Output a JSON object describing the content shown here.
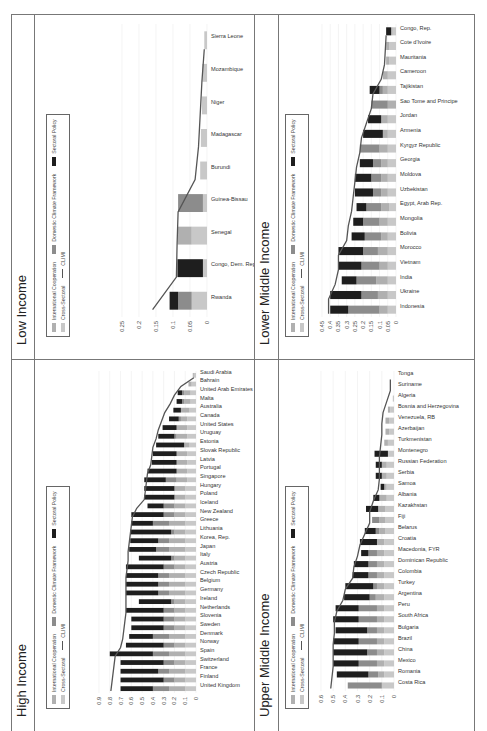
{
  "legend": {
    "items": [
      {
        "label": "International Cooperation",
        "key": "intl"
      },
      {
        "label": "Domestic Climate Framework",
        "key": "dom"
      },
      {
        "label": "Sectoral Policy",
        "key": "sect"
      },
      {
        "label": "Cross-Sectoral",
        "key": "cross"
      },
      {
        "label": "CLIMI",
        "key": "climi"
      }
    ],
    "colors": {
      "cross": "#c8c8c8",
      "intl": "#b0b0b0",
      "dom": "#8c8c8c",
      "sect": "#1e1e1e",
      "climi": "#555555"
    }
  },
  "chart_data": [
    {
      "type": "bar",
      "stacked": true,
      "title": "Low Income",
      "xlabel": "",
      "ylabel": "",
      "ylim": [
        0,
        0.25
      ],
      "yticks": [
        "0",
        "0.05",
        "0.1",
        "0.15",
        "0.2",
        "0.25"
      ],
      "categories": [
        "Rwanda",
        "Congo, Dem. Rep.",
        "Senegal",
        "Guinea-Bissau",
        "Burundi",
        "Madagascar",
        "Niger",
        "Mozambique",
        "Sierra Leone"
      ],
      "series": [
        {
          "name": "Cross-Sectoral",
          "values": [
            0.045,
            0.012,
            0.045,
            0.012,
            0.02,
            0.018,
            0.015,
            0.014,
            0.008
          ]
        },
        {
          "name": "International Cooperation",
          "values": [
            0,
            0,
            0.042,
            0,
            0,
            0,
            0,
            0,
            0
          ]
        },
        {
          "name": "Domestic Climate Framework",
          "values": [
            0.04,
            0,
            0,
            0.073,
            0,
            0,
            0,
            0,
            0
          ]
        },
        {
          "name": "Sectoral Policy",
          "values": [
            0.025,
            0.075,
            0,
            0,
            0,
            0,
            0,
            0,
            0
          ]
        },
        {
          "name": "CLIMI",
          "type": "line",
          "values": [
            0.16,
            0.09,
            0.088,
            0.085,
            0.035,
            0.025,
            0.02,
            0.015,
            0.008
          ]
        }
      ],
      "grid": true,
      "legend": "top-right"
    },
    {
      "type": "bar",
      "stacked": true,
      "title": "Lower Middle Income",
      "xlabel": "",
      "ylabel": "",
      "ylim": [
        0,
        0.45
      ],
      "yticks": [
        "0",
        "0.05",
        "0.1",
        "0.15",
        "0.2",
        "0.25",
        "0.3",
        "0.35",
        "0.4",
        "0.45"
      ],
      "categories": [
        "Indonesia",
        "Ukraine",
        "India",
        "Vietnam",
        "Morocco",
        "Bolivia",
        "Mongolia",
        "Egypt, Arab Rep.",
        "Uzbekistan",
        "Moldova",
        "Georgia",
        "Kyrgyz Republic",
        "Armenia",
        "Jordan",
        "Sao Tome and Principe",
        "Tajikistan",
        "Cameroon",
        "Mauritania",
        "Cote d'Ivoire",
        "Congo, Rep."
      ],
      "series": [
        {
          "name": "Cross-Sectoral",
          "values": [
            0.05,
            0.05,
            0.05,
            0.05,
            0.05,
            0.05,
            0.05,
            0.04,
            0.05,
            0.05,
            0.05,
            0.05,
            0.05,
            0.05,
            0.0,
            0.05,
            0.05,
            0.04,
            0.04,
            0.02
          ]
        },
        {
          "name": "International Cooperation",
          "values": [
            0.05,
            0.06,
            0.07,
            0.05,
            0.06,
            0.04,
            0.05,
            0.05,
            0.04,
            0.04,
            0.04,
            0.05,
            0.03,
            0.04,
            0.05,
            0.03,
            0.03,
            0.02,
            0.02,
            0.01
          ]
        },
        {
          "name": "Domestic Climate Framework",
          "values": [
            0.19,
            0.1,
            0.12,
            0.11,
            0.09,
            0.1,
            0.1,
            0.09,
            0.05,
            0.06,
            0.05,
            0.12,
            0,
            0,
            0.1,
            0.02,
            0.0,
            0.0,
            0,
            0
          ]
        },
        {
          "name": "Sectoral Policy",
          "values": [
            0.11,
            0.19,
            0.09,
            0.14,
            0.15,
            0.08,
            0.06,
            0.06,
            0.11,
            0.1,
            0.08,
            0,
            0.12,
            0.08,
            0,
            0.06,
            0,
            0,
            0,
            0.03
          ]
        },
        {
          "name": "CLIMI",
          "type": "line",
          "values": [
            0.41,
            0.41,
            0.37,
            0.35,
            0.35,
            0.3,
            0.29,
            0.27,
            0.26,
            0.25,
            0.24,
            0.22,
            0.21,
            0.18,
            0.15,
            0.14,
            0.09,
            0.07,
            0.065,
            0.06
          ]
        }
      ],
      "grid": true,
      "legend": "top-right"
    },
    {
      "type": "bar",
      "stacked": true,
      "title": "High Income",
      "xlabel": "",
      "ylabel": "",
      "ylim": [
        0,
        0.9
      ],
      "yticks": [
        "0",
        "0.1",
        "0.2",
        "0.3",
        "0.4",
        "0.5",
        "0.6",
        "0.7",
        "0.8",
        "0.9"
      ],
      "categories": [
        "United Kingdom",
        "Finland",
        "France",
        "Switzerland",
        "Spain",
        "Norway",
        "Denmark",
        "Sweden",
        "Slovenia",
        "Netherlands",
        "Ireland",
        "Germany",
        "Belgium",
        "Czech Republic",
        "Austria",
        "Italy",
        "Japan",
        "Korea, Rep.",
        "Lithuania",
        "Greece",
        "New Zealand",
        "Iceland",
        "Poland",
        "Hungary",
        "Singapore",
        "Portugal",
        "Latvia",
        "Slovak Republic",
        "Estonia",
        "Uruguay",
        "United States",
        "Canada",
        "Australia",
        "Malta",
        "United Arab Emirates",
        "Bahrain",
        "Saudi Arabia"
      ],
      "series": [
        {
          "name": "Cross-Sectoral",
          "values": [
            0.1,
            0.1,
            0.1,
            0.1,
            0.1,
            0.1,
            0.1,
            0.1,
            0.1,
            0.1,
            0.1,
            0.1,
            0.1,
            0.1,
            0.1,
            0.1,
            0.1,
            0.1,
            0.1,
            0.1,
            0.1,
            0.1,
            0.1,
            0.1,
            0.08,
            0.08,
            0.08,
            0.08,
            0.06,
            0.08,
            0.08,
            0.08,
            0.06,
            0.05,
            0.05,
            0.04,
            0.02
          ]
        },
        {
          "name": "International Cooperation",
          "values": [
            0.15,
            0.1,
            0.15,
            0.1,
            0.15,
            0.1,
            0.15,
            0.1,
            0.1,
            0.1,
            0.1,
            0.15,
            0.15,
            0.15,
            0.1,
            0.1,
            0.15,
            0.15,
            0.1,
            0.15,
            0.1,
            0.1,
            0.1,
            0.1,
            0.1,
            0.1,
            0.1,
            0.1,
            0.05,
            0.1,
            0.1,
            0.06,
            0.08,
            0.06,
            0.06,
            0.03,
            0.01
          ]
        },
        {
          "name": "Domestic Climate Framework",
          "values": [
            0.15,
            0.1,
            0.1,
            0.1,
            0.15,
            0.1,
            0.15,
            0.1,
            0.1,
            0.1,
            0.03,
            0.1,
            0.1,
            0.1,
            0.1,
            0.03,
            0.12,
            0.1,
            0.03,
            0.15,
            0.1,
            0.1,
            0.0,
            0.0,
            0.1,
            0.0,
            0.0,
            0.0,
            0.0,
            0.02,
            0.0,
            0.02,
            0.0,
            0.02,
            0.02,
            0.0,
            0.0
          ]
        },
        {
          "name": "Sectoral Policy",
          "values": [
            0.3,
            0.4,
            0.35,
            0.4,
            0.4,
            0.35,
            0.22,
            0.3,
            0.3,
            0.35,
            0.3,
            0.3,
            0.3,
            0.3,
            0.35,
            0.3,
            0.25,
            0.26,
            0.38,
            0.2,
            0.3,
            0.15,
            0.28,
            0.28,
            0.2,
            0.27,
            0.23,
            0.22,
            0.26,
            0.15,
            0.13,
            0.09,
            0.07,
            0.05,
            0.04,
            0.0,
            0.0
          ]
        },
        {
          "name": "CLIMI",
          "type": "line",
          "values": [
            0.79,
            0.78,
            0.77,
            0.76,
            0.75,
            0.7,
            0.68,
            0.67,
            0.66,
            0.65,
            0.65,
            0.65,
            0.65,
            0.65,
            0.64,
            0.63,
            0.63,
            0.62,
            0.61,
            0.6,
            0.59,
            0.55,
            0.48,
            0.47,
            0.46,
            0.45,
            0.42,
            0.41,
            0.4,
            0.37,
            0.35,
            0.32,
            0.29,
            0.24,
            0.2,
            0.14,
            0.02
          ]
        }
      ],
      "grid": true,
      "legend": "top-right"
    },
    {
      "type": "bar",
      "stacked": true,
      "title": "Upper Middle Income",
      "xlabel": "",
      "ylabel": "",
      "ylim": [
        0,
        0.6
      ],
      "yticks": [
        "0",
        "0.1",
        "0.2",
        "0.3",
        "0.4",
        "0.5",
        "0.6"
      ],
      "categories": [
        "Costa Rica",
        "Romania",
        "Mexico",
        "China",
        "Brazil",
        "Bulgaria",
        "South Africa",
        "Peru",
        "Argentina",
        "Turkey",
        "Colombia",
        "Dominican Republic",
        "Macedonia, FYR",
        "Croatia",
        "Belarus",
        "Fiji",
        "Kazakhstan",
        "Albania",
        "Samoa",
        "Serbia",
        "Russian Federation",
        "Montenegro",
        "Turkmenistan",
        "Azerbaijan",
        "Venezuela, RB",
        "Bosnia and Herzegovina",
        "Algeria",
        "Suriname",
        "Tonga"
      ],
      "series": [
        {
          "name": "Cross-Sectoral",
          "values": [
            0.1,
            0.08,
            0.08,
            0.08,
            0.08,
            0.08,
            0.08,
            0.08,
            0.08,
            0.08,
            0.08,
            0.08,
            0.08,
            0.08,
            0.07,
            0.07,
            0.07,
            0.06,
            0.06,
            0.06,
            0.06,
            0.05,
            0.05,
            0.04,
            0.04,
            0.03,
            0.01,
            0.0,
            0.0
          ]
        },
        {
          "name": "International Cooperation",
          "values": [
            0.0,
            0.05,
            0.06,
            0.06,
            0.06,
            0.06,
            0.06,
            0.06,
            0.07,
            0.06,
            0.06,
            0.06,
            0.06,
            0.06,
            0.05,
            0.05,
            0.06,
            0.06,
            0.02,
            0.04,
            0.04,
            0.0,
            0.03,
            0.03,
            0.03,
            0.02,
            0.0,
            0.0,
            0.0
          ]
        },
        {
          "name": "Domestic Climate Framework",
          "values": [
            0.28,
            0.08,
            0.15,
            0.08,
            0.15,
            0.08,
            0.15,
            0.15,
            0.05,
            0.03,
            0.07,
            0.07,
            0.07,
            0.0,
            0.03,
            0.06,
            0.0,
            0.0,
            0.0,
            0.0,
            0.0,
            0.0,
            0.0,
            0.0,
            0.0,
            0.0,
            0.0,
            0.0,
            0.0
          ]
        },
        {
          "name": "Sectoral Policy",
          "values": [
            0.0,
            0.26,
            0.21,
            0.28,
            0.21,
            0.26,
            0.21,
            0.19,
            0.21,
            0.23,
            0.13,
            0.12,
            0.06,
            0.14,
            0.09,
            0.0,
            0.1,
            0.05,
            0.03,
            0.05,
            0.05,
            0.11,
            0.0,
            0.0,
            0.0,
            0.0,
            0.0,
            0.0,
            0.0
          ]
        },
        {
          "name": "CLIMI",
          "type": "line",
          "values": [
            0.52,
            0.51,
            0.5,
            0.5,
            0.5,
            0.49,
            0.49,
            0.47,
            0.42,
            0.4,
            0.34,
            0.33,
            0.3,
            0.28,
            0.24,
            0.2,
            0.2,
            0.17,
            0.13,
            0.12,
            0.12,
            0.12,
            0.11,
            0.1,
            0.1,
            0.09,
            0.06,
            0.03,
            0.03
          ]
        }
      ],
      "grid": true,
      "legend": "top-right"
    }
  ]
}
